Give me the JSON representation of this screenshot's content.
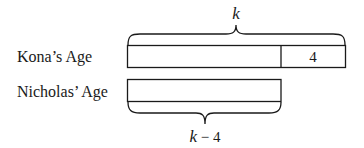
{
  "diagram": {
    "type": "tape-diagram",
    "rows": [
      {
        "label": "Kona’s Age",
        "segments": [
          {
            "text": ""
          },
          {
            "text": "4"
          }
        ]
      },
      {
        "label": "Nicholas’ Age",
        "segments": [
          {
            "text": ""
          }
        ]
      }
    ],
    "top_brace_label": "k",
    "bottom_brace_label_var": "k",
    "bottom_brace_label_rest": " − 4"
  }
}
